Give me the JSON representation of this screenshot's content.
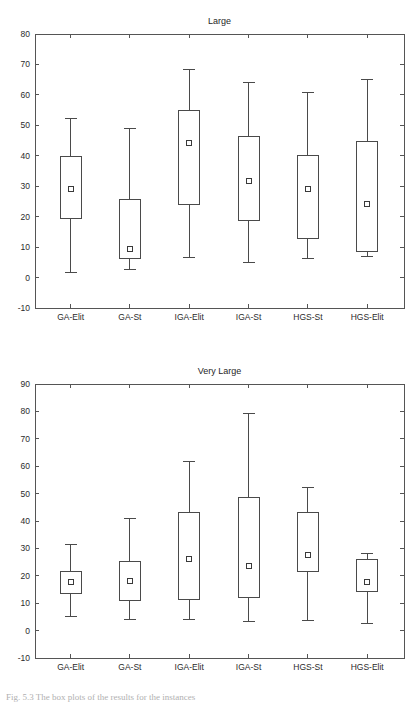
{
  "page": {
    "caption": "Fig. 5.3 The box plots of the results for the instances"
  },
  "chart_data": [
    {
      "type": "box",
      "title": "Large",
      "xlabel": "",
      "ylabel": "",
      "ylim": [
        -10,
        80
      ],
      "ytick_step": 10,
      "yticks": [
        -10,
        0,
        10,
        20,
        30,
        40,
        50,
        60,
        70,
        80
      ],
      "grid": false,
      "legend": "none",
      "categories": [
        "GA-Elit",
        "GA-St",
        "IGA-Elit",
        "IGA-St",
        "HGS-St",
        "HGS-Elit"
      ],
      "boxes": [
        {
          "category": "GA-Elit",
          "whisker_low": 1.8,
          "q1": 19.4,
          "mean": 29.0,
          "q3": 39.7,
          "whisker_high": 52.1
        },
        {
          "category": "GA-St",
          "whisker_low": 2.5,
          "q1": 6.3,
          "mean": 9.4,
          "q3": 25.8,
          "whisker_high": 49.1
        },
        {
          "category": "IGA-Elit",
          "whisker_low": 6.7,
          "q1": 23.9,
          "mean": 44.2,
          "q3": 55.0,
          "whisker_high": 68.3
        },
        {
          "category": "IGA-St",
          "whisker_low": 5.0,
          "q1": 18.8,
          "mean": 31.6,
          "q3": 46.2,
          "whisker_high": 64.2
        },
        {
          "category": "HGS-St",
          "whisker_low": 6.3,
          "q1": 12.9,
          "mean": 29.0,
          "q3": 40.2,
          "whisker_high": 60.9
        },
        {
          "category": "HGS-Elit",
          "whisker_low": 6.8,
          "q1": 8.6,
          "mean": 24.2,
          "q3": 44.7,
          "whisker_high": 65.0
        }
      ]
    },
    {
      "type": "box",
      "title": "Very Large",
      "xlabel": "",
      "ylabel": "",
      "ylim": [
        -10,
        90
      ],
      "ytick_step": 10,
      "yticks": [
        -10,
        0,
        10,
        20,
        30,
        40,
        50,
        60,
        70,
        80,
        90
      ],
      "grid": false,
      "legend": "none",
      "categories": [
        "GA-Elit",
        "GA-St",
        "IGA-Elit",
        "IGA-St",
        "HGS-St",
        "HGS-Elit"
      ],
      "boxes": [
        {
          "category": "GA-Elit",
          "whisker_low": 5.2,
          "q1": 13.7,
          "mean": 17.6,
          "q3": 21.7,
          "whisker_high": 31.3
        },
        {
          "category": "GA-St",
          "whisker_low": 3.9,
          "q1": 10.9,
          "mean": 18.0,
          "q3": 25.3,
          "whisker_high": 40.8
        },
        {
          "category": "IGA-Elit",
          "whisker_low": 4.1,
          "q1": 11.2,
          "mean": 26.1,
          "q3": 43.1,
          "whisker_high": 61.8
        },
        {
          "category": "IGA-St",
          "whisker_low": 3.4,
          "q1": 11.9,
          "mean": 23.7,
          "q3": 48.4,
          "whisker_high": 79.2
        },
        {
          "category": "HGS-St",
          "whisker_low": 3.6,
          "q1": 21.7,
          "mean": 27.6,
          "q3": 43.1,
          "whisker_high": 52.1
        },
        {
          "category": "HGS-Elit",
          "whisker_low": 2.7,
          "q1": 14.4,
          "mean": 17.6,
          "q3": 26.1,
          "whisker_high": 28.1
        }
      ]
    }
  ],
  "colors": {
    "frame": "#555555",
    "box_stroke": "#4a4a4a",
    "text": "#2b2b2b",
    "background": "#ffffff"
  }
}
